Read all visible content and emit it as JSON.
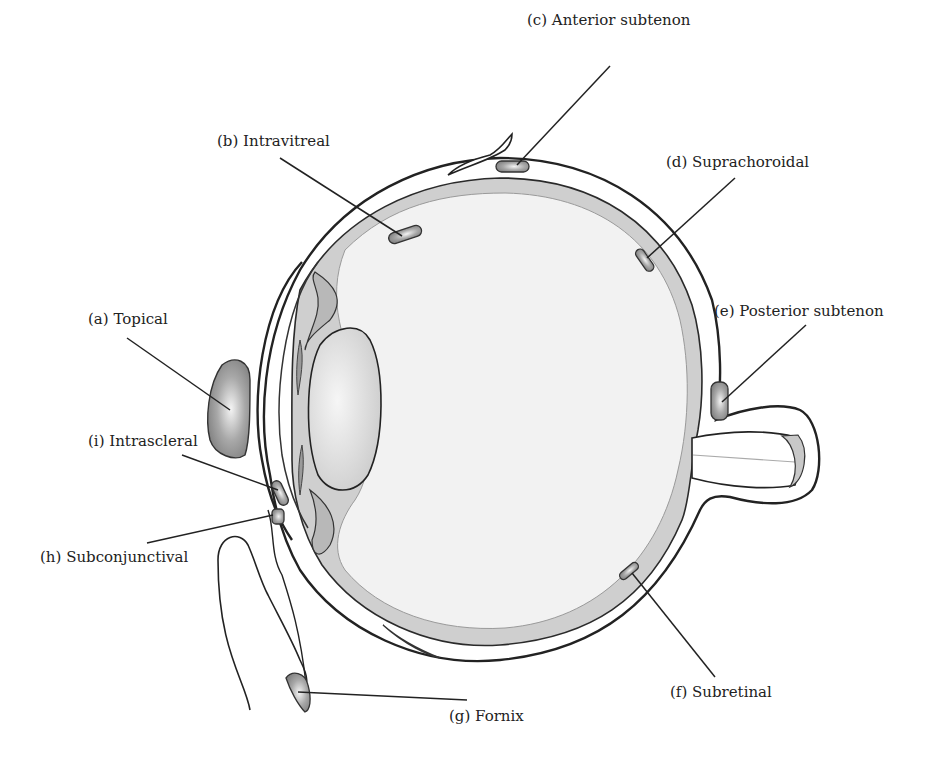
{
  "diagram": {
    "colors": {
      "outline": "#222222",
      "tissue_fill": "#cfcfcf",
      "vitreous_fill": "#f2f2f2",
      "lens_fill": "#dedede",
      "depot_fill": "#8a8a8a",
      "background": "#ffffff"
    },
    "labels": [
      {
        "id": "a",
        "text": "(a) Topical"
      },
      {
        "id": "b",
        "text": "(b) Intravitreal"
      },
      {
        "id": "c",
        "text": "(c) Anterior subtenon"
      },
      {
        "id": "d",
        "text": "(d) Suprachoroidal"
      },
      {
        "id": "e",
        "text": "(e) Posterior subtenon"
      },
      {
        "id": "f",
        "text": "(f) Subretinal"
      },
      {
        "id": "g",
        "text": "(g) Fornix"
      },
      {
        "id": "h",
        "text": "(h) Subconjunctival"
      },
      {
        "id": "i",
        "text": "(i) Intrascleral"
      }
    ]
  }
}
